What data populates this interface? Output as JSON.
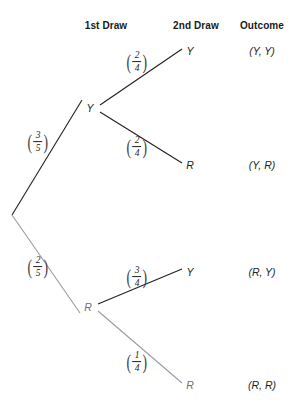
{
  "diagram": {
    "headers": {
      "first_draw": "1st Draw",
      "second_draw": "2nd Draw",
      "outcome": "Outcome"
    },
    "colors": {
      "dark_branch": "#231f20",
      "light_branch": "#9a9b9e",
      "text": "#231f20",
      "muted_text": "#6f7072",
      "background": "#ffffff"
    },
    "nodes": {
      "root": {
        "label": "",
        "x": 12,
        "y": 215
      },
      "first_y": {
        "label": "Y",
        "x": 90,
        "y": 108
      },
      "first_r": {
        "label": "R",
        "x": 88,
        "y": 307
      },
      "second_yy": {
        "label": "Y",
        "x": 190,
        "y": 51
      },
      "second_yr": {
        "label": "R",
        "x": 190,
        "y": 165
      },
      "second_ry": {
        "label": "Y",
        "x": 190,
        "y": 272
      },
      "second_rr": {
        "label": "R",
        "x": 190,
        "y": 385
      }
    },
    "branches": [
      {
        "name": "root-to-first-y",
        "probability_numerator": "3",
        "probability_denominator": "5",
        "label_x": 38,
        "label_y": 142,
        "shade": "dark"
      },
      {
        "name": "root-to-first-r",
        "probability_numerator": "2",
        "probability_denominator": "5",
        "label_x": 38,
        "label_y": 267,
        "shade": "light"
      },
      {
        "name": "first-y-to-y",
        "probability_numerator": "2",
        "probability_denominator": "4",
        "label_x": 137,
        "label_y": 62,
        "shade": "dark"
      },
      {
        "name": "first-y-to-r",
        "probability_numerator": "2",
        "probability_denominator": "4",
        "label_x": 137,
        "label_y": 147,
        "shade": "dark"
      },
      {
        "name": "first-r-to-y",
        "probability_numerator": "3",
        "probability_denominator": "4",
        "label_x": 137,
        "label_y": 277,
        "shade": "dark"
      },
      {
        "name": "first-r-to-r",
        "probability_numerator": "1",
        "probability_denominator": "4",
        "label_x": 137,
        "label_y": 362,
        "shade": "light"
      }
    ],
    "outcomes": [
      {
        "name": "outcome-yy",
        "text": "(Y, Y)",
        "x": 262,
        "y": 51
      },
      {
        "name": "outcome-yr",
        "text": "(Y, R)",
        "x": 262,
        "y": 165
      },
      {
        "name": "outcome-ry",
        "text": "(R, Y)",
        "x": 262,
        "y": 272
      },
      {
        "name": "outcome-rr",
        "text": "(R, R)",
        "x": 262,
        "y": 385
      }
    ]
  }
}
